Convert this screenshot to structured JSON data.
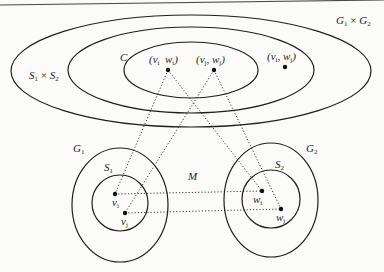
{
  "diagram": {
    "type": "set-product-mapping",
    "colors": {
      "background": "#fbfbfa",
      "stroke": "#1e1e1e",
      "dotted": "#3a3a3a"
    },
    "top_rule": {
      "x1": 0,
      "y1": 5,
      "x2": 384,
      "y2": 0
    },
    "ellipses": [
      {
        "id": "G1xG2",
        "cx": 191,
        "cy": 71,
        "rx": 180,
        "ry": 56
      },
      {
        "id": "S1xS2",
        "cx": 191,
        "cy": 70,
        "rx": 123,
        "ry": 43
      },
      {
        "id": "C",
        "cx": 191,
        "cy": 70,
        "rx": 67,
        "ry": 28
      },
      {
        "id": "G1",
        "cx": 120,
        "cy": 205,
        "rx": 48,
        "ry": 57
      },
      {
        "id": "S1",
        "cx": 120,
        "cy": 203,
        "rx": 28,
        "ry": 28
      },
      {
        "id": "G2",
        "cx": 271,
        "cy": 200,
        "rx": 47,
        "ry": 57
      },
      {
        "id": "S2",
        "cx": 271,
        "cy": 199,
        "rx": 29,
        "ry": 29
      }
    ],
    "points": [
      {
        "id": "vi_wi",
        "x": 168,
        "y": 70
      },
      {
        "id": "vj_wj",
        "x": 214,
        "y": 70
      },
      {
        "id": "vi_wj",
        "x": 285,
        "y": 67
      },
      {
        "id": "vi",
        "x": 115,
        "y": 194
      },
      {
        "id": "vj",
        "x": 125,
        "y": 213
      },
      {
        "id": "wi",
        "x": 262,
        "y": 191
      },
      {
        "id": "wj",
        "x": 281,
        "y": 209
      }
    ],
    "dotted_edges": [
      {
        "from": "vi_wi",
        "to": "vi"
      },
      {
        "from": "vi_wi",
        "to": "wi"
      },
      {
        "from": "vj_wj",
        "to": "vj"
      },
      {
        "from": "vj_wj",
        "to": "wj"
      },
      {
        "from": "vi",
        "to": "wi"
      },
      {
        "from": "vj",
        "to": "wj"
      }
    ],
    "labels": {
      "G1xG2": {
        "base1": "G",
        "sub1": "1",
        "op": " × ",
        "base2": "G",
        "sub2": "2",
        "x": 336,
        "y": 15
      },
      "S1xS2": {
        "base1": "S",
        "sub1": "1",
        "op": " × ",
        "base2": "S",
        "sub2": "2",
        "x": 29,
        "y": 70
      },
      "C": {
        "text": "C",
        "x": 120,
        "y": 52
      },
      "vi_wi": {
        "text": "(v",
        "sub1": "i",
        "mid": "  w",
        "sub2": "i",
        "end": ")",
        "x": 149,
        "y": 54
      },
      "vj_wj": {
        "text": "(v",
        "sub1": "j",
        "mid": ", w",
        "sub2": "j",
        "end": ")",
        "x": 196,
        "y": 54
      },
      "vi_wj": {
        "text": "(v",
        "sub1": "i",
        "mid": ", w",
        "sub2": "j",
        "end": ")",
        "x": 267,
        "y": 51
      },
      "G1": {
        "base": "G",
        "sub": "1",
        "x": 73,
        "y": 143
      },
      "S1": {
        "base": "S",
        "sub": "1",
        "x": 104,
        "y": 162
      },
      "M": {
        "text": "M",
        "x": 188,
        "y": 171
      },
      "G2": {
        "base": "G",
        "sub": "2",
        "x": 306,
        "y": 143
      },
      "S2": {
        "base": "S",
        "sub": "2",
        "x": 275,
        "y": 159
      },
      "vi": {
        "base": "v",
        "sub": "i",
        "x": 112,
        "y": 197
      },
      "vj": {
        "base": "v",
        "sub": "j",
        "x": 121,
        "y": 216
      },
      "wi": {
        "base": "w",
        "sub": "i",
        "x": 253,
        "y": 194
      },
      "wj": {
        "base": "w",
        "sub": "j",
        "x": 276,
        "y": 212
      }
    }
  }
}
